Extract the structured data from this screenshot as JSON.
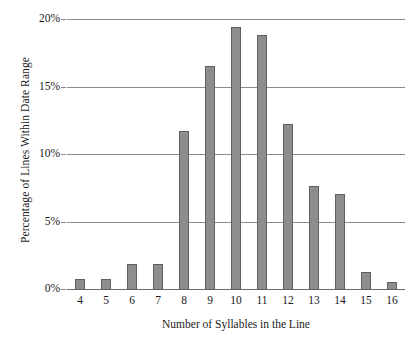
{
  "chart_data": {
    "type": "bar",
    "title": "",
    "xlabel": "Number of Syllables in the Line",
    "ylabel": "Percentage of Lines Within Date Range",
    "categories": [
      "4",
      "5",
      "6",
      "7",
      "8",
      "9",
      "10",
      "11",
      "12",
      "13",
      "14",
      "15",
      "16"
    ],
    "values": [
      0.8,
      0.8,
      1.9,
      1.9,
      11.8,
      16.6,
      19.5,
      18.9,
      12.3,
      7.7,
      7.1,
      1.3,
      0.6
    ],
    "ylim": [
      0,
      20
    ],
    "ytick_labels": [
      "0%",
      "5%",
      "10%",
      "15%",
      "20%"
    ],
    "ytick_values": [
      0,
      5,
      10,
      15,
      20
    ],
    "grid": "horizontal",
    "legend": "none",
    "bar_color": "#8d8d8d",
    "bar_edge_color": "#5f5f5f",
    "gridline_color": "#8a8a8a",
    "axis_color": "#6b6b6b",
    "background": "#ffffff"
  }
}
